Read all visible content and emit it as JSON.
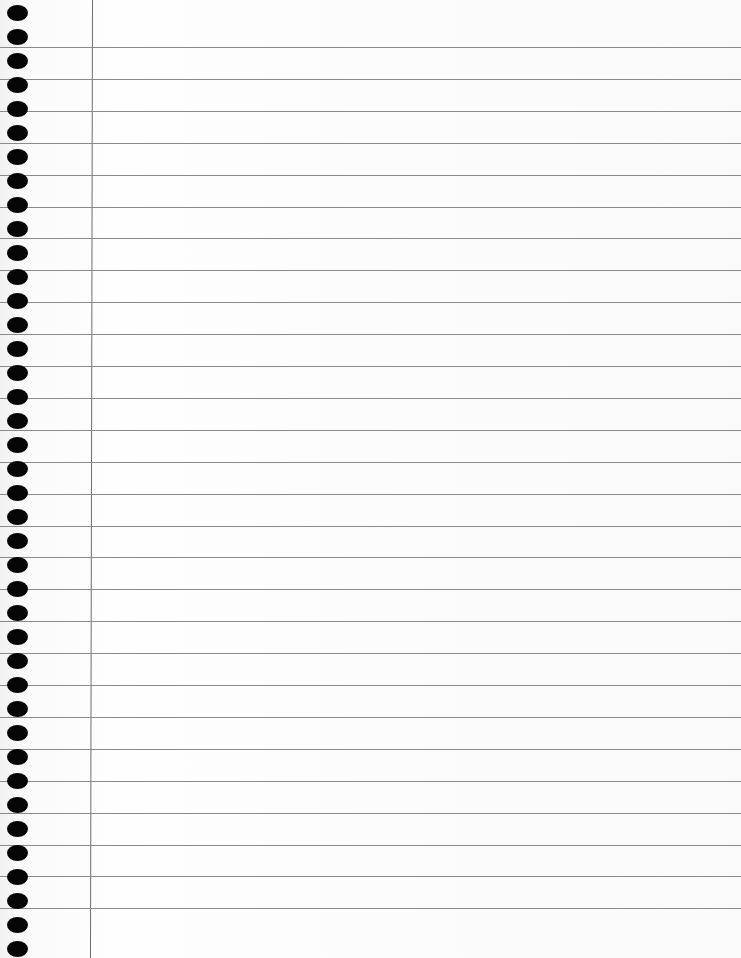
{
  "paper": {
    "type": "lined notebook paper",
    "rule_color": "#8a8a8a",
    "margin_color": "#6e6e6e",
    "hole_color": "#050505",
    "background": "#fdfdfd",
    "rule_count": 28,
    "first_rule_y": 47,
    "rule_spacing": 31.9,
    "hole_count": 40,
    "first_hole_y": 5,
    "hole_spacing": 24,
    "margin_x": 92,
    "text": ""
  }
}
